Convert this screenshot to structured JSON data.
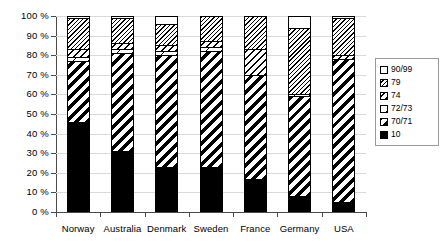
{
  "chart_data": {
    "type": "bar",
    "subtype": "stacked-percentage",
    "title": "",
    "xlabel": "",
    "ylabel": "",
    "ylim": [
      0,
      100
    ],
    "ytick_labels": [
      "0 %",
      "10 %",
      "20 %",
      "30 %",
      "40 %",
      "50 %",
      "60 %",
      "70 %",
      "80 %",
      "90 %",
      "100 %"
    ],
    "ytick_values": [
      0,
      10,
      20,
      30,
      40,
      50,
      60,
      70,
      80,
      90,
      100
    ],
    "grid": true,
    "legend_position": "right",
    "categories": [
      "Norway",
      "Australia",
      "Denmark",
      "Sweden",
      "France",
      "Germany",
      "USA"
    ],
    "series": [
      {
        "name": "10",
        "values": [
          46,
          31,
          23,
          23,
          17,
          8,
          5
        ]
      },
      {
        "name": "70/71",
        "values": [
          31,
          50,
          57,
          59,
          53,
          51,
          73
        ]
      },
      {
        "name": "72/73",
        "values": [
          2,
          2,
          2,
          2,
          0,
          1,
          0
        ]
      },
      {
        "name": "74",
        "values": [
          4,
          3,
          3,
          3,
          13,
          0,
          2
        ]
      },
      {
        "name": "79",
        "values": [
          16,
          13,
          11,
          13,
          17,
          34,
          19
        ]
      },
      {
        "name": "90/99",
        "values": [
          1,
          1,
          4,
          0,
          0,
          6,
          1
        ]
      }
    ],
    "stack_order_bottom_to_top": [
      "10",
      "70/71",
      "72/73",
      "74",
      "79",
      "90/99"
    ]
  },
  "legend": {
    "entries": [
      {
        "label": "90/99",
        "pattern": "white"
      },
      {
        "label": "79",
        "pattern": "fine-dense-hatch"
      },
      {
        "label": "74",
        "pattern": "medium-diagonal-hatch"
      },
      {
        "label": "72/73",
        "pattern": "sparse-marks"
      },
      {
        "label": "70/71",
        "pattern": "bold-diagonal-stripes"
      },
      {
        "label": "10",
        "pattern": "solid-black"
      }
    ]
  }
}
